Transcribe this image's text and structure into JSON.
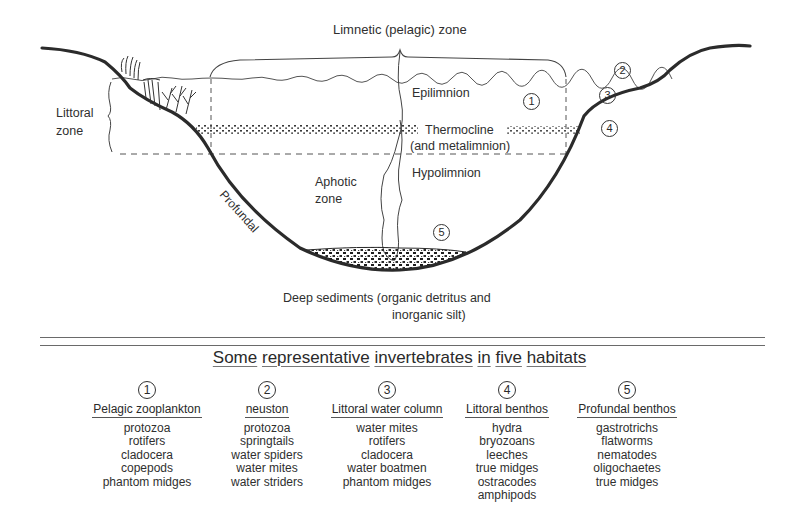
{
  "diagram": {
    "labels": {
      "limnetic_zone": "Limnetic (pelagic) zone",
      "littoral_zone_line1": "Littoral",
      "littoral_zone_line2": "zone",
      "epilimnion": "Epilimnion",
      "thermocline": "Thermocline",
      "metalimnion": "(and metalimnion)",
      "hypolimnion": "Hypolimnion",
      "aphotic_line1": "Aphotic",
      "aphotic_line2": "zone",
      "profundal": "Profundal",
      "sediments_line1": "Deep sediments (organic detritus and",
      "sediments_line2": "inorganic silt)"
    },
    "markers": {
      "m1": "1",
      "m2": "2",
      "m3": "3",
      "m4": "4",
      "m5": "5"
    }
  },
  "table": {
    "title_words": [
      "Some",
      "representative",
      "invertebrates",
      "in",
      "five",
      "habitats"
    ],
    "habitats": [
      {
        "number": "1",
        "name": "Pelagic zooplankton",
        "organisms": [
          "protozoa",
          "rotifers",
          "cladocera",
          "copepods",
          "phantom midges"
        ]
      },
      {
        "number": "2",
        "name": "neuston",
        "organisms": [
          "protozoa",
          "springtails",
          "water spiders",
          "water mites",
          "water striders"
        ]
      },
      {
        "number": "3",
        "name": "Littoral water column",
        "organisms": [
          "water mites",
          "rotifers",
          "cladocera",
          "water boatmen",
          "phantom midges"
        ]
      },
      {
        "number": "4",
        "name": "Littoral benthos",
        "organisms": [
          "hydra",
          "bryozoans",
          "leeches",
          "true midges",
          "ostracodes",
          "amphipods"
        ]
      },
      {
        "number": "5",
        "name": "Profundal benthos",
        "organisms": [
          "gastrotrichs",
          "flatworms",
          "nematodes",
          "oligochaetes",
          "true midges"
        ]
      }
    ]
  }
}
